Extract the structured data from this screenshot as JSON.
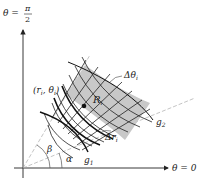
{
  "diagram": {
    "axes": {
      "vertical_label_lhs": "θ =",
      "vertical_label_num": "π",
      "vertical_label_den": "2",
      "horizontal_label": "θ = 0"
    },
    "labels": {
      "point": "(r",
      "point_sub": "i",
      "point_sep": ", θ",
      "point_sub2": "i",
      "point_close": ")",
      "region": "R",
      "region_sub": "i",
      "delta_theta": "Δθ",
      "delta_theta_sub": "i",
      "delta_r": "Δr",
      "delta_r_sub": "i",
      "g1": "g",
      "g1_sub": "1",
      "g2": "g",
      "g2_sub": "2",
      "alpha": "α",
      "beta": "β"
    },
    "colors": {
      "shade": "#c8c8c8",
      "line": "#222222",
      "dashed": "#999999"
    }
  }
}
